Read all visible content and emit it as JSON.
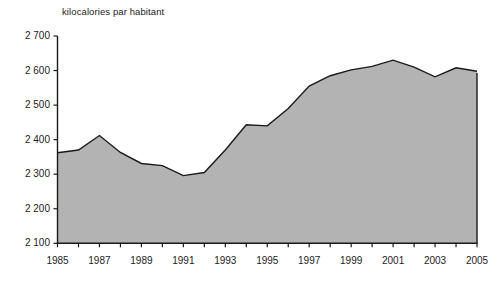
{
  "chart_data": {
    "type": "area",
    "title": "kilocalories par habitant",
    "xlabel": "",
    "ylabel": "kilocalories par habitant",
    "ylim": [
      2100,
      2700
    ],
    "xlim": [
      1985,
      2005
    ],
    "grid": false,
    "legend": "none",
    "y_ticks": [
      "2 700",
      "2 600",
      "2 500",
      "2 400",
      "2 300",
      "2 200",
      "2 100"
    ],
    "y_tick_values": [
      2700,
      2600,
      2500,
      2400,
      2300,
      2200,
      2100
    ],
    "x_ticks": [
      "1985",
      "1987",
      "1989",
      "1991",
      "1993",
      "1995",
      "1997",
      "1999",
      "2001",
      "2003",
      "2005"
    ],
    "x_tick_values": [
      1985,
      1987,
      1989,
      1991,
      1993,
      1995,
      1997,
      1999,
      2001,
      2003,
      2005
    ],
    "x": [
      1985,
      1986,
      1987,
      1988,
      1989,
      1990,
      1991,
      1992,
      1993,
      1994,
      1995,
      1996,
      1997,
      1998,
      1999,
      2000,
      2001,
      2002,
      2003,
      2004,
      2005
    ],
    "values": [
      2362,
      2370,
      2412,
      2363,
      2331,
      2325,
      2296,
      2305,
      2370,
      2443,
      2440,
      2490,
      2555,
      2585,
      2602,
      2612,
      2630,
      2610,
      2582,
      2608,
      2598
    ],
    "series": [
      {
        "name": "kilocalories par habitant",
        "values": [
          2362,
          2370,
          2412,
          2363,
          2331,
          2325,
          2296,
          2305,
          2370,
          2443,
          2440,
          2490,
          2555,
          2585,
          2602,
          2612,
          2630,
          2610,
          2582,
          2608,
          2598
        ]
      }
    ],
    "colors": {
      "area_fill": "#b3b3b3",
      "line": "#1a1a1a",
      "axis": "#1a1a1a",
      "text": "#1d1d1d",
      "background": "#ffffff"
    }
  }
}
